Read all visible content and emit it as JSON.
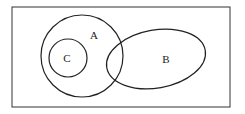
{
  "diagram": {
    "type": "venn",
    "universe": {
      "x": 12,
      "y": 7,
      "width": 218,
      "height": 100
    },
    "sets": [
      {
        "name": "A",
        "label": "A",
        "shape": "circle",
        "cx": 82,
        "cy": 56,
        "r": 41,
        "label_pos": [
          94,
          39
        ]
      },
      {
        "name": "B",
        "label": "B",
        "shape": "ellipse",
        "cx": 156,
        "cy": 59,
        "rx": 50,
        "ry": 29,
        "rotation": -10,
        "label_pos": [
          166,
          63
        ]
      },
      {
        "name": "C",
        "label": "C",
        "shape": "circle",
        "cx": 68,
        "cy": 58,
        "r": 19,
        "label_pos": [
          67,
          62
        ]
      }
    ],
    "relations": [
      "C is a subset of A",
      "A and B overlap",
      "B and C are disjoint"
    ],
    "stroke_color": "#222222"
  }
}
